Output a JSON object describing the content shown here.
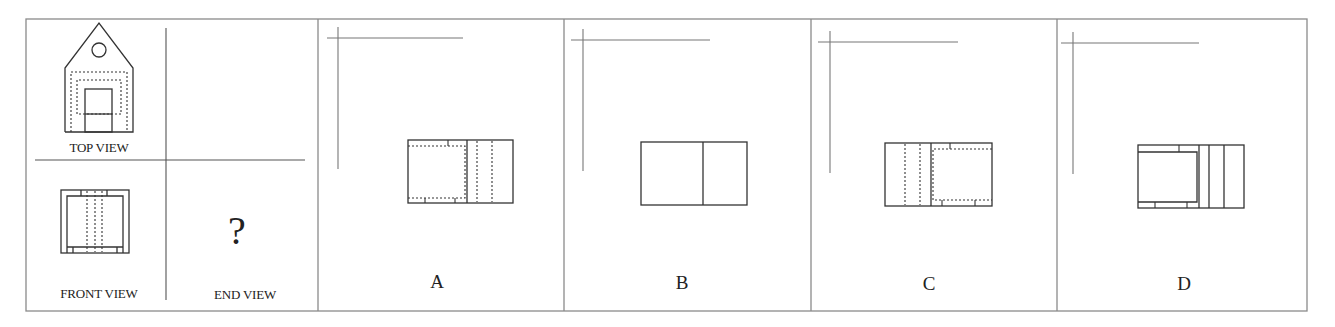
{
  "question": {
    "given_views": {
      "top_view_label": "TOP VIEW",
      "front_view_label": "FRONT VIEW",
      "end_view_label": "END VIEW",
      "unknown_marker": "?"
    },
    "options": [
      {
        "letter": "A"
      },
      {
        "letter": "B"
      },
      {
        "letter": "C"
      },
      {
        "letter": "D"
      }
    ]
  },
  "colors": {
    "line": "#333333",
    "frame": "#8a8a8a",
    "text": "#222222"
  }
}
